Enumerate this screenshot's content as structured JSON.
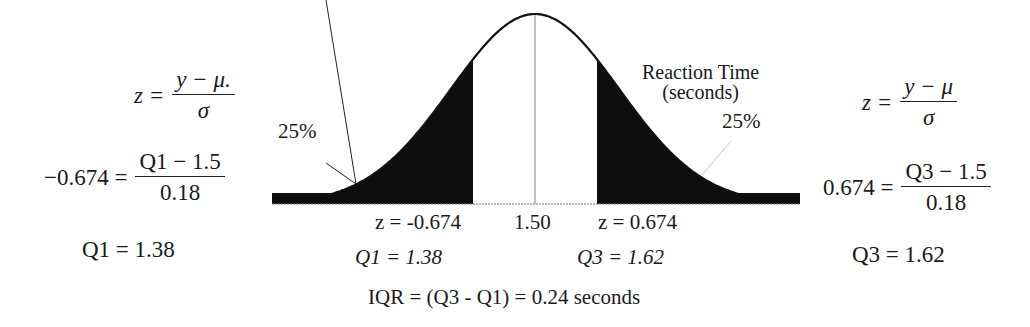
{
  "diagram": {
    "title_label": "Reaction Time",
    "title_sublabel": "(seconds)",
    "left_tail_pct": "25%",
    "right_tail_pct": "25%",
    "colors": {
      "shade": "#0d0d0d",
      "curve": "#111111",
      "background": "#ffffff"
    }
  },
  "left_calc": {
    "line1_lhs": "z =",
    "line1_num": "y − μ.",
    "line1_den": "σ",
    "line2_lhs": "−0.674 =",
    "line2_num": "Q1 − 1.5",
    "line2_den": "0.18",
    "line3": "Q1 = 1.38"
  },
  "right_calc": {
    "line1_lhs": "z =",
    "line1_num": "y − μ",
    "line1_den": "σ",
    "line2_lhs": "0.674 =",
    "line2_num": "Q3 − 1.5",
    "line2_den": "0.18",
    "line3": "Q3 = 1.62"
  },
  "axis_labels": {
    "z_left": "z = -0.674",
    "mean": "1.50",
    "z_right": "z = 0.674",
    "q1": "Q1 = 1.38",
    "q3": "Q3 = 1.62",
    "iqr": "IQR = (Q3 - Q1) = 0.24 seconds"
  }
}
